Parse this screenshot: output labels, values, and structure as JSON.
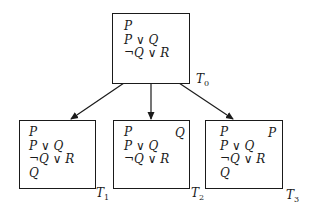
{
  "diagram": {
    "type": "tableau-tree",
    "root": {
      "label": "T",
      "label_sub": "0",
      "formulas": [
        "P",
        "P ∨ Q",
        "¬Q ∨ R"
      ],
      "extra": ""
    },
    "children": [
      {
        "label": "T",
        "label_sub": "1",
        "formulas": [
          "P",
          "P ∨ Q",
          "¬Q ∨ R",
          "Q"
        ],
        "extra": ""
      },
      {
        "label": "T",
        "label_sub": "2",
        "formulas": [
          "P",
          "P ∨ Q",
          "¬Q ∨ R"
        ],
        "extra": "Q"
      },
      {
        "label": "T",
        "label_sub": "3",
        "formulas": [
          "P",
          "P ∨ Q",
          "¬Q ∨ R",
          "Q"
        ],
        "extra": "P"
      }
    ],
    "edges": [
      {
        "from": "T0",
        "to": "T1"
      },
      {
        "from": "T0",
        "to": "T2"
      },
      {
        "from": "T0",
        "to": "T3"
      }
    ],
    "colors": {
      "stroke": "#1a1a1a",
      "background": "#ffffff"
    }
  }
}
